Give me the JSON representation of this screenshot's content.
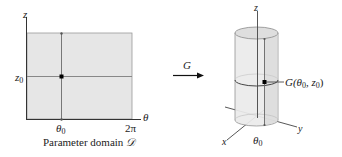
{
  "left_panel": {
    "axis_z_label": "z",
    "axis_theta_label": "θ",
    "tick_z0": "z",
    "tick_z0_sub": "0",
    "tick_theta0": "θ",
    "tick_theta0_sub": "0",
    "tick_2pi": "2π",
    "caption": "Parameter domain ",
    "caption_symbol": "𝒟",
    "fill_color": "#e6e6e6",
    "line_color": "#8a8a8a"
  },
  "arrow": {
    "label": "G"
  },
  "right_panel": {
    "axis_z_label": "z",
    "axis_x_label": "x",
    "axis_y_label": "y",
    "point_label": "G(θ",
    "point_label_sub": "0",
    "point_label_mid": ", z",
    "point_label_sub2": "0",
    "point_label_end": ")",
    "tick_theta0": "θ",
    "tick_theta0_sub": "0",
    "cylinder_color": "#ebebeb"
  }
}
